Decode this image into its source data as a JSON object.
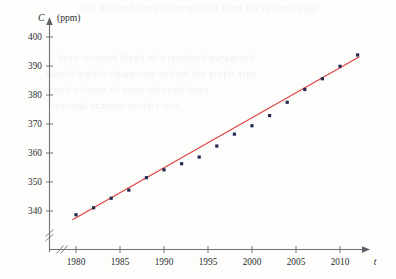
{
  "figure": {
    "background_color": "#fdfdfc",
    "ghost_text_lines": [
      "and ghosted show-through text from the reverse page",
      "faint scanned bleed of a textbook paragraph",
      "barely legible characters behind the graph area",
      "second column of show-through lines",
      "residual scanner artifact text"
    ]
  },
  "chart_data": {
    "type": "scatter",
    "title": "",
    "subtitle": "",
    "xlabel": "t",
    "ylabel": "C",
    "ylabel_units": "(ppm)",
    "x": [
      1980,
      1982,
      1984,
      1986,
      1988,
      1990,
      1992,
      1994,
      1996,
      1998,
      2000,
      2002,
      2004,
      2006,
      2008,
      2010,
      2012
    ],
    "values": [
      338.7,
      341.1,
      344.4,
      347.2,
      351.5,
      354.2,
      356.3,
      358.6,
      362.4,
      366.5,
      369.4,
      372.9,
      377.5,
      381.9,
      385.6,
      389.9,
      393.8
    ],
    "series": [
      {
        "name": "CO2 concentration",
        "marker": "square",
        "marker_color": "#232a52",
        "values": [
          338.7,
          341.1,
          344.4,
          347.2,
          351.5,
          354.2,
          356.3,
          358.6,
          362.4,
          366.5,
          369.4,
          372.9,
          377.5,
          381.9,
          385.6,
          389.9,
          393.8
        ]
      }
    ],
    "trend_line": {
      "name": "least squares regression line",
      "color": "#e0403c",
      "x_start": 1979.6,
      "y_start": 337.0,
      "x_end": 2012.2,
      "y_end": 393.2
    },
    "xlim": [
      1978.6,
      2013.6
    ],
    "ylim": [
      336.2,
      402.6
    ],
    "xticks": [
      1980,
      1985,
      1990,
      1995,
      2000,
      2005,
      2010
    ],
    "xtick_labels": [
      "1980",
      "1985",
      "1990",
      "1995",
      "2000",
      "2005",
      "2010"
    ],
    "yticks": [
      340,
      350,
      360,
      370,
      380,
      390,
      400
    ],
    "ytick_labels": [
      "340",
      "350",
      "360",
      "370",
      "380",
      "390",
      "400"
    ],
    "grid": false,
    "legend": "none",
    "x_axis_break": true,
    "y_axis_break": true,
    "x_axis_arrow": true,
    "y_axis_arrow": true
  }
}
